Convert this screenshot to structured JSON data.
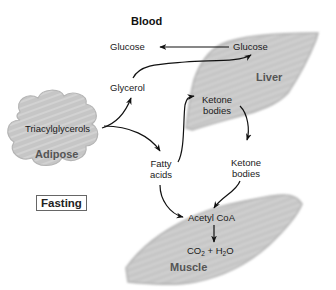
{
  "diagram": {
    "title": "Blood",
    "condition_label": "Fasting",
    "organs": {
      "liver": "Liver",
      "adipose": "Adipose",
      "muscle": "Muscle"
    },
    "nodes": {
      "glucose_blood": "Glucose",
      "glucose_liver": "Glucose",
      "glycerol": "Glycerol",
      "triacylglycerols": "Triacylglycerols",
      "ketone_liver_1": "Ketone",
      "ketone_liver_2": "bodies",
      "fatty_acids_1": "Fatty",
      "fatty_acids_2": "acids",
      "ketone_blood_1": "Ketone",
      "ketone_blood_2": "bodies",
      "acetyl_coa": "Acetyl CoA",
      "co2": "CO",
      "co2_sub": "2",
      "plus": " + ",
      "h2o_h": "H",
      "h2o_sub": "2",
      "h2o_o": "O"
    },
    "edges": [
      {
        "from": "Glucose (liver)",
        "to": "Glucose (blood)"
      },
      {
        "from": "Glycerol",
        "to": "Glucose (liver)"
      },
      {
        "from": "Triacylglycerols",
        "to": "Glycerol"
      },
      {
        "from": "Triacylglycerols",
        "to": "Fatty acids"
      },
      {
        "from": "Fatty acids",
        "to": "Ketone bodies (liver)"
      },
      {
        "from": "Ketone bodies (liver)",
        "to": "Ketone bodies (blood)"
      },
      {
        "from": "Fatty acids",
        "to": "Acetyl CoA"
      },
      {
        "from": "Ketone bodies (blood)",
        "to": "Acetyl CoA"
      },
      {
        "from": "Acetyl CoA",
        "to": "CO2 + H2O"
      }
    ],
    "colors": {
      "organ_fill": "#c4c4c4",
      "organ_edge": "#a8a8a8",
      "arrow": "#111111",
      "organ_label": "#555555"
    }
  }
}
